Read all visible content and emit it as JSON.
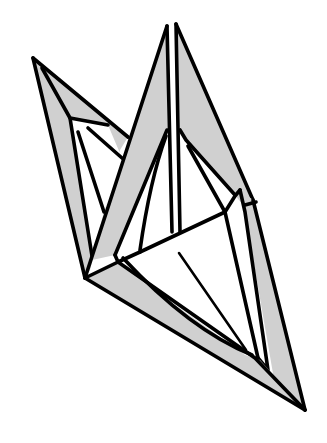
{
  "diagram": {
    "subject": "origami crane model",
    "colors": {
      "paper_shaded": "#d0d0d0",
      "paper_white": "#ffffff",
      "line": "#000000",
      "background": "#ffffff"
    },
    "parts": [
      {
        "name": "left-wing-flap",
        "shading": "gray"
      },
      {
        "name": "center-neck-flaps",
        "shading": "gray"
      },
      {
        "name": "right-edge-flap",
        "shading": "gray"
      },
      {
        "name": "bottom-body-flap",
        "shading": "gray"
      },
      {
        "name": "inner-body-facets",
        "shading": "white"
      }
    ]
  }
}
